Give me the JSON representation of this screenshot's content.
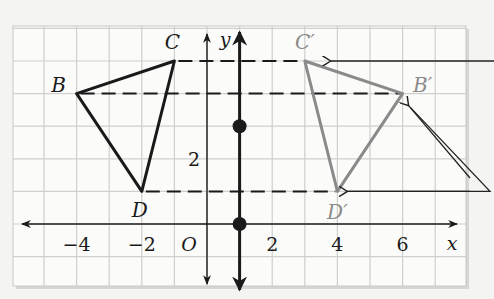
{
  "diagram": {
    "type": "coordinate-plane-reflection",
    "axes": {
      "x_label": "x",
      "y_label": "y",
      "origin_label": "O",
      "x_ticks": [
        {
          "value": -4,
          "label": "−4"
        },
        {
          "value": -2,
          "label": "−2"
        },
        {
          "value": 2,
          "label": "2"
        },
        {
          "value": 4,
          "label": "4"
        },
        {
          "value": 6,
          "label": "6"
        }
      ],
      "y_ticks": [
        {
          "value": 2,
          "label": "2"
        }
      ]
    },
    "line_of_reflection": {
      "equation_x": 1,
      "points": [
        [
          1,
          3
        ],
        [
          1,
          0
        ]
      ]
    },
    "preimage": {
      "color": "#1a1a1a",
      "vertices": [
        {
          "name": "B",
          "label": "B",
          "x": -4,
          "y": 4
        },
        {
          "name": "C",
          "label": "C",
          "x": -1,
          "y": 5
        },
        {
          "name": "D",
          "label": "D",
          "x": -2,
          "y": 1
        }
      ]
    },
    "image": {
      "color": "#8a8a8a",
      "vertices": [
        {
          "name": "B'",
          "label": "B′",
          "x": 6,
          "y": 4
        },
        {
          "name": "C'",
          "label": "C′",
          "x": 3,
          "y": 5
        },
        {
          "name": "D'",
          "label": "D′",
          "x": 4,
          "y": 1
        }
      ]
    },
    "dashed_connectors": [
      {
        "from": "C",
        "to": "C'",
        "y": 5
      },
      {
        "from": "B",
        "to": "B'",
        "y": 4
      },
      {
        "from": "D",
        "to": "D'",
        "y": 1
      }
    ],
    "callout_arrows": [
      {
        "target": "C'"
      },
      {
        "target": "B'"
      },
      {
        "target": "D'"
      }
    ]
  }
}
